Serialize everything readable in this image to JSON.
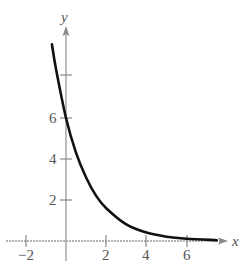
{
  "chart_data": {
    "type": "line",
    "title": "",
    "xlabel": "x",
    "ylabel": "y",
    "xlim": [
      -3,
      8.5
    ],
    "ylim": [
      -0.5,
      10.5
    ],
    "x_ticks": [
      -2,
      2,
      4,
      6
    ],
    "x_tick_labels": [
      "−2",
      "2",
      "4",
      "6"
    ],
    "y_ticks": [
      2,
      4,
      6,
      8
    ],
    "y_tick_labels": [
      "2",
      "4",
      "6",
      ""
    ],
    "grid": false,
    "legend": null,
    "series": [
      {
        "name": "f(x)",
        "description": "decreasing exponential, approx y = 6e^(-0.67x)",
        "x": [
          -0.7,
          -0.5,
          0,
          0.5,
          1,
          1.5,
          2,
          3,
          4,
          5,
          6,
          7.5
        ],
        "y": [
          9.6,
          8.4,
          6.0,
          4.3,
          3.1,
          2.2,
          1.6,
          0.81,
          0.41,
          0.21,
          0.11,
          0.04
        ]
      }
    ]
  },
  "labels": {
    "x_axis": "x",
    "y_axis": "y",
    "xt_m2": "−2",
    "xt_2": "2",
    "xt_4": "4",
    "xt_6": "6",
    "yt_2": "2",
    "yt_4": "4",
    "yt_6": "6"
  },
  "colors": {
    "curve": "#111111",
    "axis": "#888888",
    "text": "#555555"
  }
}
